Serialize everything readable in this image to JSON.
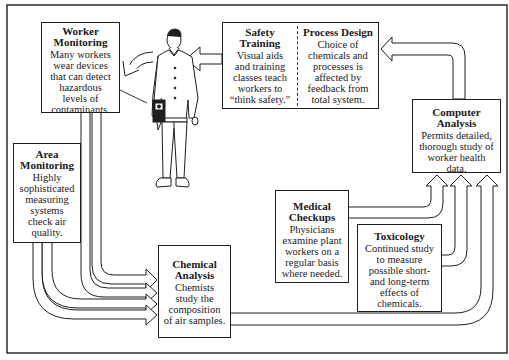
{
  "diagram": {
    "colors": {
      "line": "#1e1e1e",
      "background": "#ffffff"
    },
    "nodes": {
      "worker_monitoring": {
        "title_1": "Worker",
        "title_2": "Monitoring",
        "lines": [
          "Many workers",
          "wear devices",
          "that can detect",
          "hazardous",
          "levels of",
          "contaminants."
        ]
      },
      "area_monitoring": {
        "title_1": "Area",
        "title_2": "Monitoring",
        "lines": [
          "Highly",
          "sophisticated",
          "measuring",
          "systems",
          "check air",
          "quality."
        ]
      },
      "safety_training": {
        "title_1": "Safety",
        "title_2": "Training",
        "lines": [
          "Visual aids",
          "and training",
          "classes teach",
          "workers to",
          "“think safety.”"
        ]
      },
      "process_design": {
        "title_1": "Process Design",
        "lines": [
          "Choice of",
          "chemicals and",
          "processes is",
          "affected by",
          "feedback from",
          "total system."
        ]
      },
      "computer_analysis": {
        "title_1": "Computer",
        "title_2": "Analysis",
        "lines": [
          "Permits detailed,",
          "thorough study of",
          "worker health",
          "data."
        ]
      },
      "medical_checkups": {
        "title_1": "Medical",
        "title_2": "Checkups",
        "lines": [
          "Physicians",
          "examine plant",
          "workers on a",
          "regular basis",
          "where needed."
        ]
      },
      "toxicology": {
        "title_1": "Toxicology",
        "lines": [
          "Continued study",
          "to measure",
          "possible short-",
          "and long-term",
          "effects of",
          "chemicals."
        ]
      },
      "chemical_analysis": {
        "title_1": "Chemical",
        "title_2": "Analysis",
        "lines": [
          "Chemists",
          "study the",
          "composition",
          "of air samples."
        ]
      }
    },
    "figure": {
      "icon": "worker-figure-icon",
      "device": "monitor-badge-icon"
    }
  }
}
